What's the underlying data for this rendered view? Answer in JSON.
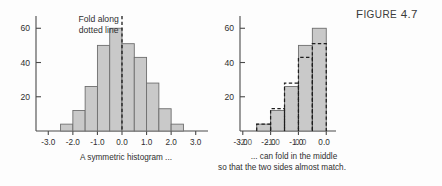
{
  "figure": {
    "label_prefix": "F",
    "label_rest": "IGURE",
    "number": "4.7",
    "full_label": "FIGURE 4.7"
  },
  "colors": {
    "bar_fill": "#c9c9c9",
    "bar_stroke": "#6e6e6e",
    "axis": "#4a4a4a",
    "dashed": "#1e1e1e",
    "text": "#2f2f2f",
    "background": "#fdfdfd"
  },
  "left_panel": {
    "annotation_line1": "Fold along",
    "annotation_line2": "dotted line",
    "caption": "A symmetric histogram ...",
    "fold_line_x_value": 0.0
  },
  "right_panel": {
    "caption_line1": "... can fold in the middle",
    "caption_line2": "so that the two sides almost match."
  },
  "chart_data": [
    {
      "id": "symmetric-histogram",
      "type": "bar",
      "title": "A symmetric histogram ...",
      "xlabel": "",
      "ylabel": "",
      "xlim": [
        -3.5,
        3.5
      ],
      "ylim": [
        0,
        66
      ],
      "yticks": [
        20,
        40,
        60
      ],
      "ytick_labels": [
        "20",
        "40",
        "60"
      ],
      "xticks": [
        -3.0,
        -2.0,
        -1.0,
        0.0,
        1.0,
        2.0,
        3.0
      ],
      "xtick_labels": [
        "-3.0",
        "-2.0",
        "-1.0",
        "0.0",
        "1.0",
        "2.0",
        "3.0"
      ],
      "bin_width": 0.5,
      "bin_starts": [
        -2.5,
        -2.0,
        -1.5,
        -1.0,
        -0.5,
        0.0,
        0.5,
        1.0,
        1.5,
        2.0
      ],
      "values": [
        4,
        12,
        26,
        50,
        60,
        51,
        43,
        28,
        13,
        4
      ],
      "grid": false,
      "legend": "none",
      "annotations": [
        {
          "text": "Fold along",
          "x": -0.95,
          "y": 66
        },
        {
          "text": "dotted line",
          "x": -0.95,
          "y": 60
        },
        {
          "text": "fold-line",
          "x": 0.0,
          "style": "dashed-vertical"
        }
      ]
    },
    {
      "id": "folded-histogram",
      "type": "bar",
      "title": "... can fold in the middle",
      "subtitle": "so that the two sides almost match.",
      "xlabel": "",
      "ylabel": "",
      "xlim": [
        -3.1,
        0.35
      ],
      "ylim": [
        0,
        66
      ],
      "yticks": [
        20,
        40,
        60
      ],
      "ytick_labels": [
        "20",
        "40",
        "60"
      ],
      "xticks": [
        -3.0,
        -2.0,
        -1.0,
        0.0
      ],
      "xtick_labels": [
        "-3.0",
        "-2.0",
        "-1.0",
        "0.0"
      ],
      "xtick_labels_overprint": [
        "-2.0",
        "-1.0",
        "0.0",
        ""
      ],
      "bin_width": 0.5,
      "bin_starts": [
        -2.5,
        -2.0,
        -1.5,
        -1.0,
        -0.5
      ],
      "series": [
        {
          "name": "left half (solid)",
          "style": "solid-filled",
          "values": [
            4,
            12,
            26,
            50,
            60
          ]
        },
        {
          "name": "right half folded over (dashed)",
          "style": "dashed-outline",
          "values": [
            4,
            13,
            28,
            43,
            51
          ]
        }
      ],
      "grid": false,
      "legend": "none"
    }
  ]
}
